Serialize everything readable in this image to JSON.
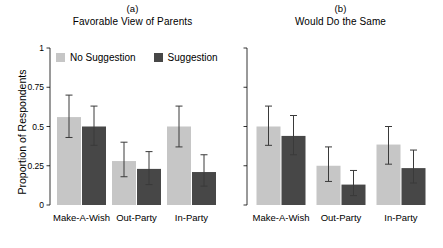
{
  "figure": {
    "ylabel": "Proportion of Respondents",
    "legend": {
      "items": [
        {
          "label": "No Suggestion",
          "color": "#c6c6c6",
          "key": "no_suggestion"
        },
        {
          "label": "Suggestion",
          "color": "#474747",
          "key": "suggestion"
        }
      ]
    }
  },
  "chart_data": [
    {
      "type": "bar",
      "panel_tag": "(a)",
      "title": "Favorable View of Parents",
      "xlabel": "",
      "ylabel": "Proportion of Respondents",
      "ylim": [
        0,
        1
      ],
      "yticks": [
        0,
        0.25,
        0.5,
        0.75,
        1
      ],
      "ytick_labels": [
        "0",
        "0.25",
        "0.5",
        "0.75",
        "1"
      ],
      "show_ytick_labels": true,
      "grid": false,
      "legend_position": "top-left",
      "categories": [
        "Make-A-Wish",
        "Out-Party",
        "In-Party"
      ],
      "series": [
        {
          "name": "No Suggestion",
          "color": "#c6c6c6",
          "values": [
            0.56,
            0.28,
            0.5
          ],
          "ci_low": [
            0.43,
            0.18,
            0.37
          ],
          "ci_high": [
            0.7,
            0.4,
            0.63
          ]
        },
        {
          "name": "Suggestion",
          "color": "#474747",
          "values": [
            0.5,
            0.23,
            0.21
          ],
          "ci_low": [
            0.38,
            0.13,
            0.12
          ],
          "ci_high": [
            0.63,
            0.34,
            0.32
          ]
        }
      ]
    },
    {
      "type": "bar",
      "panel_tag": "(b)",
      "title": "Would Do the Same",
      "xlabel": "",
      "ylabel": "",
      "ylim": [
        0,
        1
      ],
      "yticks": [
        0,
        0.25,
        0.5,
        0.75,
        1
      ],
      "ytick_labels": [
        "",
        "",
        "",
        "",
        ""
      ],
      "show_ytick_labels": false,
      "grid": false,
      "legend_position": "none",
      "categories": [
        "Make-A-Wish",
        "Out-Party",
        "In-Party"
      ],
      "series": [
        {
          "name": "No Suggestion",
          "color": "#c6c6c6",
          "values": [
            0.5,
            0.25,
            0.385
          ],
          "ci_low": [
            0.38,
            0.15,
            0.26
          ],
          "ci_high": [
            0.63,
            0.37,
            0.5
          ]
        },
        {
          "name": "Suggestion",
          "color": "#474747",
          "values": [
            0.44,
            0.13,
            0.235
          ],
          "ci_low": [
            0.32,
            0.06,
            0.14
          ],
          "ci_high": [
            0.57,
            0.22,
            0.35
          ]
        }
      ]
    }
  ]
}
